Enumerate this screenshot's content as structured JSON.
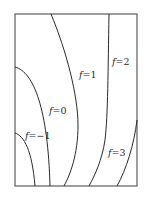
{
  "diagram": {
    "type": "contour-plot",
    "frame": {
      "x": 15,
      "y": 14,
      "width": 122,
      "height": 172
    },
    "colors": {
      "frame": "#6a6a6a",
      "contour": "#2a2a2a",
      "background": "#ffffff"
    },
    "contours": [
      {
        "id": "f-neg1",
        "level": -1,
        "label": {
          "var": "f",
          "eq": "=",
          "value": "−1",
          "x": 25,
          "y": 139
        },
        "path": "M15,133 C24,136 32,150 35,186"
      },
      {
        "id": "f-0",
        "level": 0,
        "label": {
          "var": "f",
          "eq": "=",
          "value": "0",
          "x": 49,
          "y": 114
        },
        "path": "M15,67 C34,72 48,110 50,186"
      },
      {
        "id": "f-1",
        "level": 1,
        "label": {
          "var": "f",
          "eq": "=",
          "value": "1",
          "x": 79,
          "y": 78
        },
        "path": "M51,14 C66,50 78,95 78,125 C78,155 70,175 64,186"
      },
      {
        "id": "f-2",
        "level": 2,
        "label": {
          "var": "f",
          "eq": "=",
          "value": "2",
          "x": 112,
          "y": 65
        },
        "path": "M109,14 C108,70 108,115 105,140 C102,160 95,175 89,186"
      },
      {
        "id": "f-3",
        "level": 3,
        "label": {
          "var": "f",
          "eq": "=",
          "value": "3",
          "x": 108,
          "y": 156
        },
        "path": "M137,120 C134,145 126,170 117,186"
      }
    ]
  }
}
